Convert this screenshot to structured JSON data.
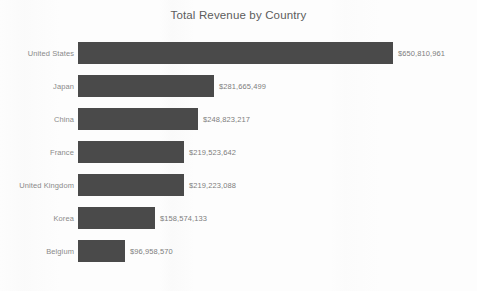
{
  "chart_data": {
    "type": "bar",
    "orientation": "horizontal",
    "title": "Total Revenue by Country",
    "xlabel": "",
    "ylabel": "",
    "grid": false,
    "legend": null,
    "axis_ticks_visible": false,
    "categories": [
      "United States",
      "Japan",
      "China",
      "France",
      "United Kingdom",
      "Korea",
      "Belgium"
    ],
    "values": [
      650810961,
      281665499,
      248823217,
      219523642,
      219223088,
      158574133,
      96958570
    ],
    "value_labels": [
      "$650,810,961",
      "$281,665,499",
      "$248,823,217",
      "$219,523,642",
      "$219,223,088",
      "$158,574,133",
      "$96,958,570"
    ],
    "xlim": [
      0,
      650810961
    ],
    "bar_color": "#4a4a4a",
    "label_color": "#8a8a8a",
    "value_label_color": "#7d7d7d",
    "title_color": "#5c5c5c",
    "background_color": "#fdfdfd"
  },
  "bars": [
    {
      "category": "United States",
      "value": 650810961,
      "label": "$650,810,961"
    },
    {
      "category": "Japan",
      "value": 281665499,
      "label": "$281,665,499"
    },
    {
      "category": "China",
      "value": 248823217,
      "label": "$248,823,217"
    },
    {
      "category": "France",
      "value": 219523642,
      "label": "$219,523,642"
    },
    {
      "category": "United Kingdom",
      "value": 219223088,
      "label": "$219,223,088"
    },
    {
      "category": "Korea",
      "value": 158574133,
      "label": "$158,574,133"
    },
    {
      "category": "Belgium",
      "value": 96958570,
      "label": "$96,958,570"
    }
  ]
}
